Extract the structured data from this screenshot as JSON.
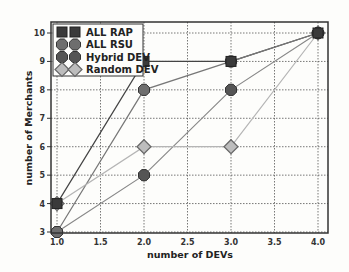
{
  "chart_data": {
    "type": "line",
    "title": "",
    "xlabel": "number of DEVs",
    "ylabel": "number of Merchants",
    "x": [
      1.0,
      2.0,
      3.0,
      4.0
    ],
    "xlim": [
      1.0,
      4.0
    ],
    "ylim": [
      3,
      10
    ],
    "xticks": [
      "1.0",
      "1.5",
      "2.0",
      "2.5",
      "3.0",
      "3.5",
      "4.0"
    ],
    "yticks": [
      "3",
      "4",
      "5",
      "6",
      "7",
      "8",
      "9",
      "10"
    ],
    "grid": true,
    "legend_position": "upper left",
    "series": [
      {
        "name": "ALL RAP",
        "marker": "square",
        "color": "#3a3a3a",
        "values": [
          4,
          9,
          9,
          10
        ]
      },
      {
        "name": "ALL RSU",
        "marker": "hexagon",
        "color": "#6e6e6e",
        "values": [
          3,
          8,
          9,
          10
        ]
      },
      {
        "name": "Hybrid DEV",
        "marker": "hexagon",
        "color": "#555555",
        "values": [
          3,
          5,
          8,
          10
        ]
      },
      {
        "name": "Random DEV",
        "marker": "diamond",
        "color": "#a0a0a0",
        "values": [
          4,
          6,
          6,
          10
        ]
      }
    ]
  },
  "legend": {
    "items": [
      "ALL RAP",
      "ALL RSU",
      "Hybrid DEV",
      "Random DEV"
    ]
  }
}
